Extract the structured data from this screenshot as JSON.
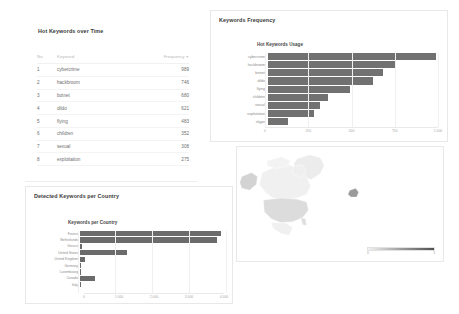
{
  "panels": {
    "table_panel": {
      "title": "Hot Keywords over Time",
      "columns": {
        "no": "No",
        "keyword": "Keyword",
        "frequency": "Frequency",
        "sort_caret": "▼"
      },
      "rows": [
        {
          "no": "1",
          "keyword": "cybercrime",
          "frequency": "989"
        },
        {
          "no": "2",
          "keyword": "hackbroom",
          "frequency": "746"
        },
        {
          "no": "3",
          "keyword": "botnet",
          "frequency": "680"
        },
        {
          "no": "4",
          "keyword": "dildo",
          "frequency": "621"
        },
        {
          "no": "5",
          "keyword": "flying",
          "frequency": "483"
        },
        {
          "no": "6",
          "keyword": "children",
          "frequency": "352"
        },
        {
          "no": "7",
          "keyword": "sexual",
          "frequency": "308"
        },
        {
          "no": "8",
          "keyword": "exploitation",
          "frequency": "275"
        }
      ]
    },
    "frequency_panel": {
      "title": "Keywords Frequency"
    },
    "country_panel": {
      "title": "Detected Keywords per Country"
    },
    "map_panel": {
      "legend_min": "0",
      "legend_max": "3"
    }
  },
  "chart_data": [
    {
      "type": "bar",
      "orientation": "horizontal",
      "title": "Hot Keywords Usage",
      "xlabel": "",
      "ylabel": "",
      "categories": [
        "cybercrime",
        "hackbroom",
        "botnet",
        "dildo",
        "flying",
        "children",
        "sexual",
        "exploitation",
        "skype"
      ],
      "values": [
        989,
        746,
        680,
        621,
        483,
        352,
        308,
        275,
        120
      ],
      "xlim": [
        0,
        1000
      ],
      "ticks": [
        "0",
        "250",
        "500",
        "750",
        "1 000"
      ],
      "tick_values": [
        0,
        250,
        500,
        750,
        1000
      ],
      "grid": true,
      "legend": "none",
      "bar_color": "#717171"
    },
    {
      "type": "bar",
      "orientation": "horizontal",
      "title": "Keywords per Country",
      "xlabel": "",
      "ylabel": "",
      "categories": [
        "France",
        "Netherlands",
        "Greece",
        "United States",
        "United Kingdom",
        "Germany",
        "Luxembourg",
        "Canada",
        "Italy"
      ],
      "values": [
        3860,
        3760,
        60,
        1290,
        150,
        40,
        15,
        420,
        10
      ],
      "xlim": [
        0,
        4000
      ],
      "ticks": [
        "0",
        "1 000",
        "2 000",
        "3 000",
        "4 000"
      ],
      "tick_values": [
        0,
        1000,
        2000,
        3000,
        4000
      ],
      "grid": true,
      "legend": "none",
      "bar_color": "#6b6b6b"
    },
    {
      "type": "heatmap",
      "subtype": "choropleth-map",
      "title": "",
      "region": "North America",
      "legend_range": [
        0,
        3
      ],
      "regions": [
        {
          "name": "Canada",
          "value": 0.4
        },
        {
          "name": "United States",
          "value": 1.2
        },
        {
          "name": "Alaska",
          "value": 1.6
        },
        {
          "name": "Greenland",
          "value": 0.2
        },
        {
          "name": "Mexico",
          "value": 0.1
        },
        {
          "name": "Iceland",
          "value": 2.0
        }
      ],
      "colorscale": [
        "#f2f2f2",
        "#9d9d9d",
        "#4f4f4f"
      ]
    }
  ]
}
